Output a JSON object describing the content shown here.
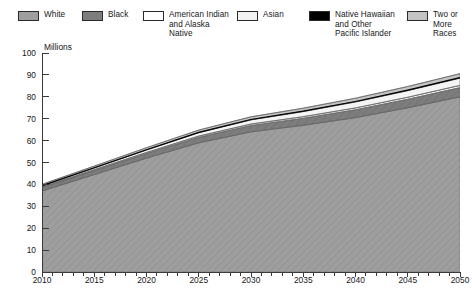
{
  "legend": {
    "items": [
      {
        "label": "White",
        "color": "#9e9e9e",
        "name": "legend-swatch-white",
        "x": 18,
        "y": 10,
        "label_x": 44
      },
      {
        "label": "Black",
        "color": "#7d7d7d",
        "name": "legend-swatch-black",
        "x": 82,
        "y": 10,
        "label_x": 108
      },
      {
        "label": "American Indian\nand Alaska\nNative",
        "color": "#ffffff",
        "name": "legend-swatch-american-indian-alaska-native",
        "x": 143,
        "y": 10,
        "label_x": 169
      },
      {
        "label": "Asian",
        "color": "#f2f2f2",
        "name": "legend-swatch-asian",
        "x": 237,
        "y": 10,
        "label_x": 263
      },
      {
        "label": "Native Hawaiian\nand Other\nPacific Islander",
        "color": "#000000",
        "name": "legend-swatch-native-hawaiian-pacific-islander",
        "x": 309,
        "y": 10,
        "label_x": 335
      },
      {
        "label": "Two or\nMore\nRaces",
        "color": "#c4c4c4",
        "name": "legend-swatch-two-or-more-races",
        "x": 407,
        "y": 10,
        "label_x": 433
      }
    ]
  },
  "chart_data": {
    "type": "area",
    "stacked": true,
    "title": "",
    "xlabel": "",
    "ylabel": "Millions",
    "axis_title": "Millions",
    "xlim": [
      2010,
      2050
    ],
    "ylim": [
      0,
      100
    ],
    "ytick_step": 10,
    "xtick_step": 5,
    "xminor_step": 1,
    "grid": false,
    "legend_position": "top",
    "yticks": [
      0,
      10,
      20,
      30,
      40,
      50,
      60,
      70,
      80,
      90,
      100
    ],
    "xticks": [
      2010,
      2015,
      2020,
      2025,
      2030,
      2035,
      2040,
      2045,
      2050
    ],
    "xtick_labels": [
      "2010",
      "2015",
      "2020",
      "2025",
      "2030",
      "2035",
      "2040",
      "2045",
      "2050"
    ],
    "ytick_labels": [
      "0",
      "10",
      "20",
      "30",
      "40",
      "50",
      "60",
      "70",
      "80",
      "90",
      "100"
    ],
    "x": [
      2010,
      2015,
      2020,
      2025,
      2030,
      2035,
      2040,
      2045,
      2050
    ],
    "series": [
      {
        "name": "White",
        "color": "#9e9e9e",
        "hatch": true,
        "values": [
          37.0,
          44.5,
          52.0,
          59.0,
          64.0,
          67.0,
          70.5,
          75.0,
          80.0
        ]
      },
      {
        "name": "Black",
        "color": "#7d7d7d",
        "hatch": true,
        "values": [
          1.5,
          1.8,
          2.1,
          2.5,
          2.9,
          3.2,
          3.6,
          3.9,
          4.2
        ]
      },
      {
        "name": "American Indian and Alaska Native",
        "color": "#ffffff",
        "hatch": false,
        "values": [
          0.35,
          0.42,
          0.5,
          0.58,
          0.66,
          0.74,
          0.82,
          0.9,
          1.0
        ]
      },
      {
        "name": "Asian",
        "color": "#f4f4f4",
        "hatch": false,
        "values": [
          0.45,
          0.75,
          1.1,
          1.5,
          1.9,
          2.3,
          2.7,
          3.0,
          3.3
        ]
      },
      {
        "name": "Native Hawaiian and Other Pacific Islander",
        "color": "#000000",
        "hatch": false,
        "values": [
          0.12,
          0.14,
          0.16,
          0.18,
          0.2,
          0.22,
          0.24,
          0.26,
          0.28
        ]
      },
      {
        "name": "Two or More Races",
        "color": "#c4c4c4",
        "hatch": true,
        "values": [
          0.6,
          0.75,
          0.9,
          1.05,
          1.2,
          1.35,
          1.5,
          1.65,
          1.8
        ]
      }
    ],
    "totals": [
      40.02,
      48.36,
      56.76,
      64.81,
      70.86,
      74.81,
      79.36,
      84.71,
      90.58
    ]
  }
}
